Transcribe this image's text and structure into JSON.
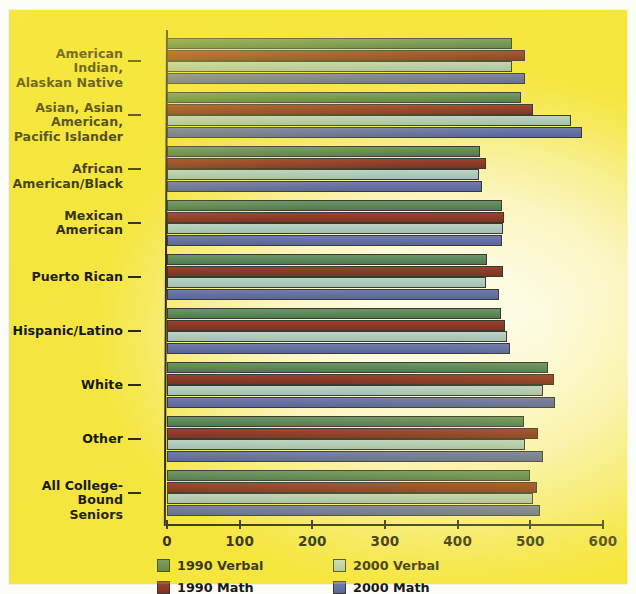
{
  "chart_data": {
    "type": "bar",
    "orientation": "horizontal",
    "title": "",
    "xlabel": "",
    "ylabel": "",
    "xlim": [
      0,
      600
    ],
    "xticks": [
      0,
      100,
      200,
      300,
      400,
      500,
      600
    ],
    "xtick_labels": [
      "0",
      "100",
      "200",
      "300",
      "400",
      "500",
      "600"
    ],
    "grid": false,
    "legend_position": "bottom",
    "categories": [
      "American Indian,\nAlaskan Native",
      "Asian, Asian American,\nPacific Islander",
      "African American/Black",
      "Mexican\nAmerican",
      "Puerto Rican",
      "Hispanic/Latino",
      "White",
      "Other",
      "All College-Bound\nSeniors"
    ],
    "series": [
      {
        "name": "1990 Verbal",
        "color": "#5e8a5c",
        "values": [
          475,
          487,
          431,
          461,
          440,
          460,
          524,
          491,
          500
        ]
      },
      {
        "name": "1990 Math",
        "color": "#8d3b2a",
        "values": [
          493,
          504,
          439,
          464,
          463,
          465,
          532,
          511,
          509
        ]
      },
      {
        "name": "2000 Verbal",
        "color": "#afcabb",
        "values": [
          475,
          556,
          430,
          463,
          439,
          468,
          517,
          493,
          503
        ]
      },
      {
        "name": "2000 Math",
        "color": "#6571a3",
        "values": [
          493,
          571,
          433,
          461,
          457,
          472,
          534,
          517,
          513
        ]
      }
    ]
  },
  "legend": {
    "entries": [
      {
        "label": "1990 Verbal",
        "swatch": "green-swatch"
      },
      {
        "label": "1990 Math",
        "swatch": "dark-red-swatch"
      },
      {
        "label": "2000 Verbal",
        "swatch": "light-blue-swatch"
      },
      {
        "label": "2000 Math",
        "swatch": "blue-swatch"
      }
    ]
  },
  "colors": {
    "background_edge": "#f5e63f",
    "background_center": "#fdfbe6",
    "axis": "#2b2b24",
    "series_1990_verbal": "#5e8a5c",
    "series_1990_math": "#8d3b2a",
    "series_2000_verbal": "#afcabb",
    "series_2000_math": "#6571a3"
  }
}
